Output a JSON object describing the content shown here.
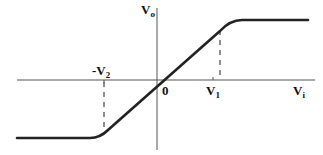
{
  "diagram": {
    "type": "transfer-characteristic",
    "axes": {
      "y_label": {
        "main": "V",
        "sub": "o"
      },
      "x_label": {
        "main": "V",
        "sub": "i"
      },
      "origin_label": "0"
    },
    "markers": {
      "positive_break": {
        "main": "V",
        "sub": "1"
      },
      "negative_break": {
        "main": "-V",
        "sub": "2"
      }
    },
    "colors": {
      "curve": "#222222",
      "axis": "#555555",
      "dash": "#444444",
      "text": "#111111",
      "background": "#ffffff"
    },
    "geometry": {
      "origin": [
        157,
        80
      ],
      "x_axis": [
        17,
        315
      ],
      "y_axis": [
        8,
        150
      ],
      "upper_plateau_y": 20,
      "lower_plateau_y": 138,
      "v1_x": 213,
      "neg_v2_x": 104
    }
  }
}
